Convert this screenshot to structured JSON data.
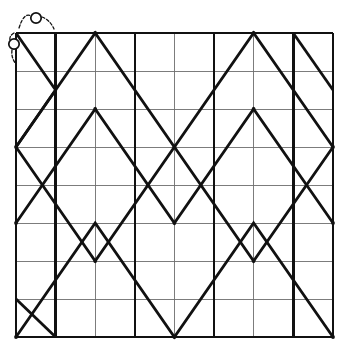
{
  "figure": {
    "type": "lattice-zigzag-diagram",
    "title": "",
    "canvas": {
      "width": 339,
      "height": 349,
      "background": "#ffffff"
    },
    "colors": {
      "grid_thin": "#6e6e6e",
      "grid_thick": "#111111",
      "path": "#111111",
      "annotation": "#111111",
      "background": "#ffffff"
    },
    "grid": {
      "x_start": 16,
      "x_end": 333,
      "y_start": 33,
      "y_end": 337,
      "columns": 8,
      "rows": 8,
      "cell_width": 39.6,
      "cell_height": 38.0,
      "thin_line_width": 0.9,
      "thick_line_width": 2.6,
      "vertical_x": [
        16,
        55.6,
        95.2,
        134.8,
        174.4,
        214.0,
        253.6,
        293.2,
        333
      ],
      "horizontal_y": [
        33,
        71,
        109,
        147,
        185,
        223,
        261,
        299,
        337
      ],
      "thick_vertical_x": [
        16,
        55.6,
        134.8,
        214.0,
        293.2,
        333
      ],
      "thick_horizontal_y": []
    },
    "path": {
      "stroke_width": 2.8,
      "description": "Two interleaved zigzag polylines forming diamond and X crossings across the lattice",
      "polylines": [
        {
          "name": "zigzag-upper",
          "points": [
            [
              16,
              147
            ],
            [
              95.2,
              33
            ],
            [
              174.4,
              147
            ],
            [
              253.6,
              33
            ],
            [
              333,
              147
            ]
          ]
        },
        {
          "name": "zigzag-lower-a",
          "points": [
            [
              16,
              147
            ],
            [
              95.2,
              261
            ],
            [
              174.4,
              147
            ],
            [
              253.6,
              261
            ],
            [
              333,
              147
            ]
          ]
        },
        {
          "name": "zigzag-upper-b",
          "points": [
            [
              16,
              337
            ],
            [
              95.2,
              223
            ],
            [
              174.4,
              337
            ],
            [
              253.6,
              223
            ],
            [
              333,
              337
            ]
          ]
        },
        {
          "name": "zigzag-lower-b",
          "points": [
            [
              16,
              223
            ],
            [
              95.2,
              109
            ],
            [
              174.4,
              223
            ],
            [
              253.6,
              109
            ],
            [
              333,
              223
            ]
          ]
        },
        {
          "name": "zigzag-mid-descend",
          "points": [
            [
              16,
              33
            ],
            [
              55.6,
              90
            ],
            [
              16,
              147
            ]
          ]
        },
        {
          "name": "zigzag-edge-top-right",
          "points": [
            [
              293.2,
              33
            ],
            [
              333,
              90
            ]
          ]
        },
        {
          "name": "zigzag-edge-bottom-left",
          "points": [
            [
              16,
              299
            ],
            [
              55.6,
              337
            ]
          ]
        }
      ],
      "nodes": [
        [
          16,
          147
        ],
        [
          95.2,
          33
        ],
        [
          174.4,
          147
        ],
        [
          253.6,
          33
        ],
        [
          333,
          147
        ],
        [
          16,
          223
        ],
        [
          95.2,
          109
        ],
        [
          174.4,
          223
        ],
        [
          253.6,
          109
        ],
        [
          333,
          223
        ],
        [
          16,
          337
        ],
        [
          95.2,
          261
        ],
        [
          174.4,
          337
        ],
        [
          253.6,
          261
        ],
        [
          333,
          337
        ]
      ]
    },
    "annotations": {
      "circles": [
        {
          "name": "circle-marker-top",
          "cx": 36,
          "cy": 18,
          "r": 5.2
        },
        {
          "name": "circle-marker-left",
          "cx": 14,
          "cy": 44,
          "r": 5.2
        }
      ],
      "arcs": [
        {
          "name": "arc-bracket-top",
          "d": "M 19 28 Q 24 12 31 16"
        },
        {
          "name": "arc-bracket-top-right",
          "d": "M 42 17 Q 50 20 54 29"
        },
        {
          "name": "arc-bracket-left-upper",
          "d": "M 14 33 Q 9 36 10 40"
        },
        {
          "name": "arc-bracket-left-lower",
          "d": "M 12 50 Q 11 58 16 64"
        }
      ],
      "dash_pattern": "3 2",
      "stroke_width": 1.3
    }
  }
}
